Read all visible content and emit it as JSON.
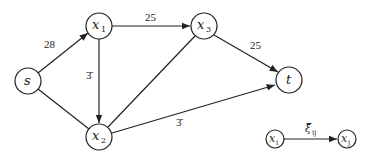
{
  "diagram": {
    "type": "directed-flow-network",
    "nodes": [
      {
        "id": "s",
        "label": "s",
        "sub": "",
        "x": 28,
        "y": 81
      },
      {
        "id": "x1",
        "label": "x",
        "sub": "1",
        "x": 99,
        "y": 26
      },
      {
        "id": "x3",
        "label": "x",
        "sub": "3",
        "x": 204,
        "y": 26
      },
      {
        "id": "t",
        "label": "t",
        "sub": "",
        "x": 289,
        "y": 80
      },
      {
        "id": "x2",
        "label": "x",
        "sub": "2",
        "x": 99,
        "y": 137
      }
    ],
    "edges": [
      {
        "from": "s",
        "to": "x1",
        "label": "28",
        "arrow": true
      },
      {
        "from": "x1",
        "to": "x3",
        "label": "25",
        "arrow": true
      },
      {
        "from": "x3",
        "to": "t",
        "label": "25",
        "arrow": true
      },
      {
        "from": "x1",
        "to": "x2",
        "label": "3̄",
        "arrow": true
      },
      {
        "from": "x2",
        "to": "t",
        "label": "3̄",
        "arrow": true
      },
      {
        "from": "s",
        "to": "x2",
        "label": "",
        "arrow": false
      },
      {
        "from": "x2",
        "to": "x3",
        "label": "",
        "arrow": false
      }
    ],
    "node_radius": 13
  },
  "legend": {
    "from": {
      "label": "x",
      "sub": "i"
    },
    "to": {
      "label": "x",
      "sub": "j"
    },
    "edge_label": "ξ̄",
    "edge_sub": "ij"
  }
}
